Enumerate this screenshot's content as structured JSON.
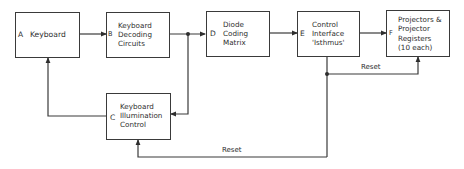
{
  "diagram": {
    "blocks": [
      {
        "id": "A",
        "letter": "A",
        "label": "Keyboard"
      },
      {
        "id": "B",
        "letter": "B",
        "label": "Keyboard\nDecoding\nCircuits"
      },
      {
        "id": "C",
        "letter": "C",
        "label": "Keyboard\nIllumination\nControl"
      },
      {
        "id": "D",
        "letter": "D",
        "label": "Diode\nCoding\nMatrix"
      },
      {
        "id": "E",
        "letter": "E",
        "label": "Control\nInterface\n'Isthmus'"
      },
      {
        "id": "F",
        "letter": "F",
        "label": "Projectors &\nProjector\nRegisters\n(10 each)"
      }
    ],
    "edges": [
      {
        "from": "A",
        "to": "B",
        "label": ""
      },
      {
        "from": "B",
        "to": "D",
        "label": ""
      },
      {
        "from": "B",
        "to": "C",
        "label": ""
      },
      {
        "from": "D",
        "to": "E",
        "label": ""
      },
      {
        "from": "E",
        "to": "F",
        "label": ""
      },
      {
        "from": "E",
        "to": "F",
        "label": "Reset"
      },
      {
        "from": "E",
        "to": "C",
        "label": "Reset"
      },
      {
        "from": "C",
        "to": "A",
        "label": ""
      }
    ],
    "reset_label_upper": "Reset",
    "reset_label_lower": "Reset",
    "line_color": "#3a3a3a"
  }
}
